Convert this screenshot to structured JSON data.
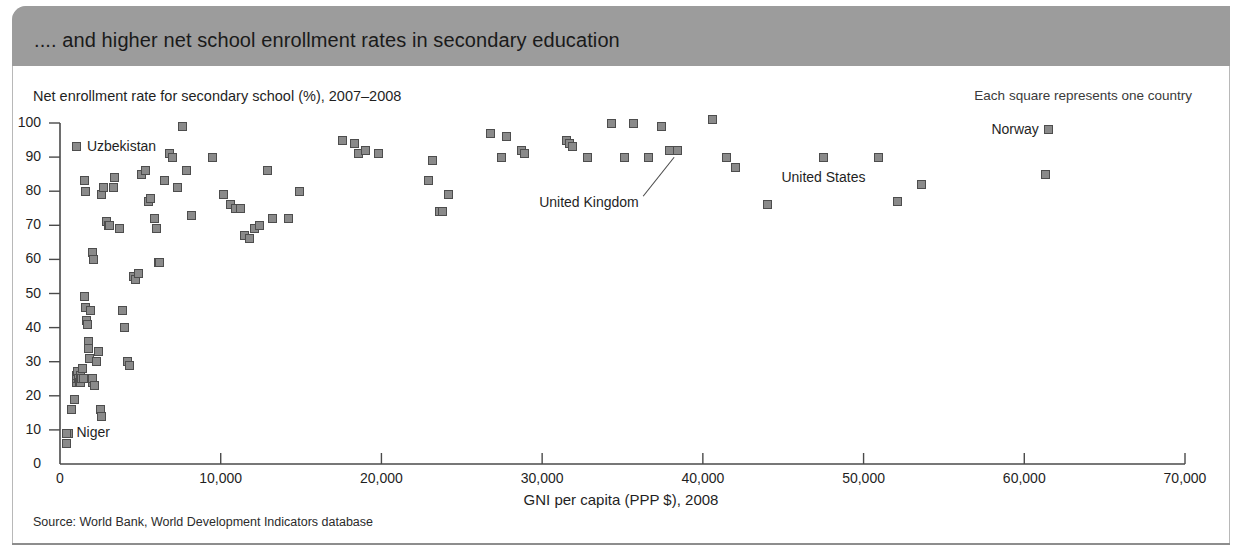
{
  "header": {
    "title": ".... and higher net school enrollment rates in secondary education"
  },
  "legend_note": "Each square represents one country",
  "source": "Source: World Bank, World Development Indicators database",
  "chart_data": {
    "type": "scatter",
    "title": ".... and higher net school enrollment rates in secondary education",
    "ylabel": "Net enrollment rate for secondary school (%), 2007–2008",
    "xlabel": "GNI per capita (PPP $), 2008",
    "xlim": [
      0,
      70000
    ],
    "ylim": [
      0,
      100
    ],
    "grid": false,
    "legend": "Each square represents one country",
    "xticks": [
      0,
      10000,
      20000,
      30000,
      40000,
      50000,
      60000,
      70000
    ],
    "xticklabels": [
      "0",
      "10,000",
      "20,000",
      "30,000",
      "40,000",
      "50,000",
      "60,000",
      "70,000"
    ],
    "yticks": [
      0,
      10,
      20,
      30,
      40,
      50,
      60,
      70,
      80,
      90,
      100
    ],
    "yticklabels": [
      "0",
      "10",
      "20",
      "30",
      "40",
      "50",
      "60",
      "70",
      "80",
      "90",
      "100"
    ],
    "marker": "square",
    "marker_color": "#8a8a8a",
    "marker_edge_color": "#4d4d4d",
    "points": [
      [
        400,
        6
      ],
      [
        500,
        9
      ],
      [
        700,
        16
      ],
      [
        900,
        19
      ],
      [
        1000,
        24
      ],
      [
        1000,
        25
      ],
      [
        1050,
        26
      ],
      [
        1100,
        27
      ],
      [
        1150,
        25
      ],
      [
        1200,
        24
      ],
      [
        1250,
        26
      ],
      [
        1300,
        24
      ],
      [
        1350,
        25
      ],
      [
        1400,
        28
      ],
      [
        1450,
        25
      ],
      [
        1500,
        49
      ],
      [
        1550,
        49
      ],
      [
        1600,
        46
      ],
      [
        1650,
        42
      ],
      [
        1700,
        41
      ],
      [
        1750,
        36
      ],
      [
        1800,
        34
      ],
      [
        1850,
        31
      ],
      [
        1900,
        45
      ],
      [
        1950,
        25
      ],
      [
        2000,
        24
      ],
      [
        2050,
        25
      ],
      [
        2150,
        23
      ],
      [
        2300,
        30
      ],
      [
        2400,
        33
      ],
      [
        2500,
        16
      ],
      [
        2600,
        14
      ],
      [
        1500,
        83
      ],
      [
        1600,
        80
      ],
      [
        2000,
        62
      ],
      [
        2100,
        60
      ],
      [
        2600,
        79
      ],
      [
        2700,
        81
      ],
      [
        2900,
        71
      ],
      [
        3000,
        70
      ],
      [
        3100,
        70
      ],
      [
        3300,
        81
      ],
      [
        3400,
        84
      ],
      [
        3700,
        69
      ],
      [
        3900,
        45
      ],
      [
        4000,
        40
      ],
      [
        4200,
        30
      ],
      [
        4300,
        29
      ],
      [
        4600,
        55
      ],
      [
        4700,
        54
      ],
      [
        4900,
        56
      ],
      [
        5100,
        85
      ],
      [
        5300,
        86
      ],
      [
        5500,
        77
      ],
      [
        5600,
        78
      ],
      [
        5900,
        72
      ],
      [
        6000,
        69
      ],
      [
        6100,
        59
      ],
      [
        6200,
        59
      ],
      [
        6500,
        83
      ],
      [
        6800,
        91
      ],
      [
        7000,
        90
      ],
      [
        7300,
        81
      ],
      [
        7600,
        99
      ],
      [
        7900,
        86
      ],
      [
        8200,
        73
      ],
      [
        9500,
        90
      ],
      [
        10200,
        79
      ],
      [
        10600,
        76
      ],
      [
        10900,
        75
      ],
      [
        11200,
        75
      ],
      [
        11500,
        67
      ],
      [
        11800,
        66
      ],
      [
        12100,
        69
      ],
      [
        12400,
        70
      ],
      [
        12900,
        86
      ],
      [
        13200,
        72
      ],
      [
        14200,
        72
      ],
      [
        14900,
        80
      ],
      [
        17600,
        95
      ],
      [
        18300,
        94
      ],
      [
        18600,
        91
      ],
      [
        19000,
        92
      ],
      [
        19800,
        91
      ],
      [
        22900,
        83
      ],
      [
        23600,
        74
      ],
      [
        23800,
        74
      ],
      [
        24200,
        79
      ],
      [
        23200,
        89
      ],
      [
        26800,
        97
      ],
      [
        27500,
        90
      ],
      [
        27800,
        96
      ],
      [
        28700,
        92
      ],
      [
        28900,
        91
      ],
      [
        31500,
        95
      ],
      [
        31700,
        94
      ],
      [
        31900,
        93
      ],
      [
        32800,
        90
      ],
      [
        34300,
        100
      ],
      [
        35100,
        90
      ],
      [
        35700,
        100
      ],
      [
        36600,
        90
      ],
      [
        37400,
        99
      ],
      [
        37900,
        92
      ],
      [
        38400,
        92
      ],
      [
        40600,
        101
      ],
      [
        41500,
        90
      ],
      [
        42000,
        87
      ],
      [
        44000,
        76
      ],
      [
        47500,
        90
      ],
      [
        50900,
        90
      ],
      [
        52100,
        77
      ],
      [
        53600,
        82
      ],
      [
        61300,
        85
      ],
      [
        61500,
        98
      ]
    ],
    "annotations": [
      {
        "label": "Uzbekistan",
        "x": 1050,
        "y": 93,
        "marker_x": 1050,
        "marker_y": 93,
        "text_side": "right",
        "leader": false
      },
      {
        "label": "Niger",
        "x": 400,
        "y": 9,
        "marker_x": 400,
        "marker_y": 9,
        "text_side": "right",
        "leader": false
      },
      {
        "label": "United Kingdom",
        "x": 38400,
        "y": 92,
        "marker_x": 38400,
        "marker_y": 92,
        "text_side": "left-below",
        "leader": true
      },
      {
        "label": "United States",
        "x": 47500,
        "y": 90,
        "marker_x": 47500,
        "marker_y": 90,
        "text_side": "below",
        "leader": false
      },
      {
        "label": "Norway",
        "x": 61500,
        "y": 98,
        "marker_x": 61500,
        "marker_y": 98,
        "text_side": "left",
        "leader": false
      }
    ]
  }
}
